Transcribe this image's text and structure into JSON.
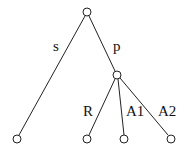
{
  "diagram": {
    "type": "tree",
    "nodes": [
      {
        "id": "root",
        "x": 87,
        "y": 12
      },
      {
        "id": "mid",
        "x": 117,
        "y": 75
      },
      {
        "id": "leaf1",
        "x": 17,
        "y": 139
      },
      {
        "id": "leaf2",
        "x": 87,
        "y": 139
      },
      {
        "id": "leaf3",
        "x": 124,
        "y": 139
      },
      {
        "id": "leaf4",
        "x": 171,
        "y": 139
      }
    ],
    "edges": [
      {
        "from": "root",
        "to": "leaf1",
        "label": "s",
        "lx": 53,
        "ly": 51
      },
      {
        "from": "root",
        "to": "mid",
        "label": "p",
        "lx": 113,
        "ly": 51
      },
      {
        "from": "mid",
        "to": "leaf2",
        "label": "R",
        "lx": 83,
        "ly": 116
      },
      {
        "from": "mid",
        "to": "leaf3",
        "label": "A1",
        "lx": 126,
        "ly": 116
      },
      {
        "from": "mid",
        "to": "leaf4",
        "label": "A2",
        "lx": 158,
        "ly": 116
      }
    ]
  }
}
